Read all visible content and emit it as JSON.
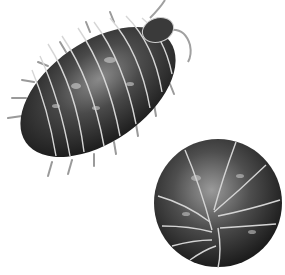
{
  "image": {
    "description": "Illustration of two pill bugs (woodlice): one extended, one rolled into a ball",
    "subjects": [
      {
        "name": "extended-pill-bug",
        "pose": "crawling, viewed from above"
      },
      {
        "name": "rolled-pill-bug",
        "pose": "curled into a ball"
      }
    ],
    "colors": {
      "background": "#ffffff",
      "body_dark": "#2a2a2a",
      "body_mid": "#5a5a5a",
      "highlight": "#cfcfcf",
      "segment_line": "#d8d8d8"
    }
  }
}
